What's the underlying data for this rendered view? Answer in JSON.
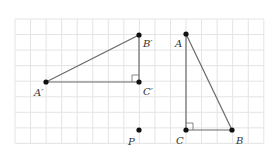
{
  "diagram": {
    "grid": {
      "x0": 15,
      "y0": 19,
      "cols": 16,
      "rows": 8,
      "cell": 15.55,
      "color": "#e4e4e4"
    },
    "stroke_color": "#6b6b6b",
    "point_color": "#111111",
    "triangles": [
      {
        "name": "triangle-ABC",
        "points": {
          "A": [
            186,
            34
          ],
          "B": [
            232,
            130
          ],
          "C": [
            186,
            130
          ]
        },
        "right_angle_at": "C"
      },
      {
        "name": "triangle-A'B'C'",
        "points": {
          "A'": [
            46,
            82
          ],
          "B'": [
            139,
            35
          ],
          "C'": [
            139,
            82
          ]
        },
        "right_angle_at": "C'"
      }
    ],
    "extra_points": {
      "P": [
        139,
        130
      ]
    },
    "labels": {
      "A": {
        "text": "A",
        "x": 175,
        "y": 47
      },
      "B": {
        "text": "B",
        "x": 236,
        "y": 144
      },
      "C": {
        "text": "C",
        "x": 176,
        "y": 144
      },
      "A_prime": {
        "text": "A′",
        "x": 34,
        "y": 96
      },
      "B_prime": {
        "text": "B′",
        "x": 143,
        "y": 47
      },
      "C_prime": {
        "text": "C′",
        "x": 143,
        "y": 95
      },
      "P": {
        "text": "P",
        "x": 128,
        "y": 145
      }
    }
  }
}
